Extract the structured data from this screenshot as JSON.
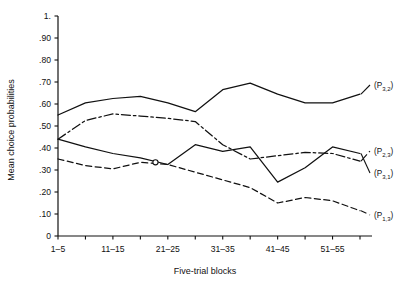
{
  "chart_data": {
    "type": "line",
    "title": "",
    "xlabel": "Five-trial blocks",
    "ylabel": "Mean choice probabilities",
    "grid": false,
    "legend_position": "right-inline",
    "xlim": [
      1,
      12
    ],
    "ylim": [
      0,
      1.0
    ],
    "x": [
      1,
      2,
      3,
      4,
      5,
      6,
      7,
      8,
      9,
      10,
      11,
      12
    ],
    "categories": [
      "1-5",
      "6-10",
      "11-15",
      "16-20",
      "21-25",
      "26-30",
      "31-35",
      "36-40",
      "41-45",
      "46-50",
      "51-55",
      "56-60"
    ],
    "xtick_positions": [
      1,
      3,
      5,
      7,
      9,
      11
    ],
    "xtick_labels": [
      "1–5",
      "11–15",
      "21–25",
      "31–35",
      "41–45",
      "51–55"
    ],
    "ytick_values": [
      1.0,
      0.9,
      0.8,
      0.7,
      0.6,
      0.5,
      0.4,
      0.3,
      0.2,
      0.1,
      0.0
    ],
    "ytick_labels": [
      "1.",
      ".90",
      ".80",
      ".70",
      ".60",
      ".50",
      ".40",
      ".30",
      ".20",
      ".10",
      "0"
    ],
    "series": [
      {
        "name": "(P3,2)",
        "label_base": "(P",
        "label_sub": "3,2",
        "style": "solid",
        "color": "#111111",
        "values": [
          0.55,
          0.605,
          0.625,
          0.635,
          0.605,
          0.565,
          0.665,
          0.695,
          0.645,
          0.605,
          0.605,
          0.645
        ]
      },
      {
        "name": "(P2,3)",
        "label_base": "(P",
        "label_sub": "2,3",
        "style": "dashdot",
        "color": "#111111",
        "values": [
          0.44,
          0.525,
          0.555,
          0.545,
          0.535,
          0.52,
          0.415,
          0.35,
          0.365,
          0.38,
          0.375,
          0.34
        ]
      },
      {
        "name": "(P3,1)",
        "label_base": "(P",
        "label_sub": "3,1",
        "style": "solid",
        "color": "#111111",
        "values": [
          0.44,
          0.405,
          0.375,
          0.355,
          0.325,
          0.415,
          0.385,
          0.405,
          0.245,
          0.31,
          0.405,
          0.375
        ]
      },
      {
        "name": "(P1,3)",
        "label_base": "(P",
        "label_sub": "1,3",
        "style": "dashed",
        "color": "#111111",
        "values": [
          0.35,
          0.32,
          0.305,
          0.335,
          0.325,
          0.29,
          0.255,
          0.22,
          0.15,
          0.175,
          0.16,
          0.115
        ]
      }
    ],
    "annotations": [
      {
        "text": "(P3,2)",
        "target_series": "(P3,2)"
      },
      {
        "text": "(P2,3)",
        "target_series": "(P2,3)"
      },
      {
        "text": "(P3,1)",
        "target_series": "(P3,1)"
      },
      {
        "text": "(P1,3)",
        "target_series": "(P1,3)"
      }
    ]
  }
}
